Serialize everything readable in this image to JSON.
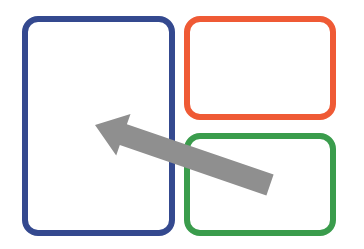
{
  "diagram": {
    "panels": [
      {
        "id": "left",
        "color": "#34498f",
        "x": 22,
        "y": 16,
        "w": 153,
        "h": 220,
        "radius": 16,
        "stroke": 6
      },
      {
        "id": "top-right",
        "color": "#ef5a35",
        "x": 184,
        "y": 16,
        "w": 152,
        "h": 104,
        "radius": 16,
        "stroke": 6
      },
      {
        "id": "bottom-right",
        "color": "#3a9c4c",
        "x": 184,
        "y": 133,
        "w": 152,
        "h": 103,
        "radius": 16,
        "stroke": 6
      }
    ],
    "arrow": {
      "color": "#8f8f8f",
      "direction": "up-left",
      "from": [
        270,
        185
      ],
      "to": [
        95,
        125
      ]
    }
  }
}
